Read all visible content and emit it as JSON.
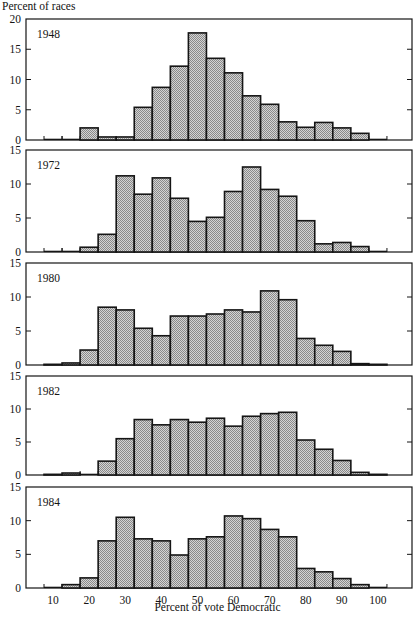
{
  "chart_data": {
    "type": "bar",
    "subtype": "histogram-small-multiples",
    "title": "",
    "ylabel": "Percent of races",
    "xlabel": "Percent of vote Democratic",
    "x_ticks": [
      10,
      20,
      30,
      40,
      50,
      60,
      70,
      80,
      90,
      100
    ],
    "xlim": [
      7.5,
      102.5
    ],
    "bin_width": 5,
    "categories": [
      10,
      15,
      20,
      25,
      30,
      35,
      40,
      45,
      50,
      55,
      60,
      65,
      70,
      75,
      80,
      85,
      90,
      95,
      100
    ],
    "grid": false,
    "legend": null,
    "fill": "halftone gray",
    "panels": [
      {
        "label": "1948",
        "ylim": [
          0,
          20
        ],
        "y_ticks": [
          0,
          5,
          10,
          15,
          20
        ],
        "values": [
          0,
          0,
          2.0,
          0.5,
          0.5,
          5.4,
          8.7,
          12.2,
          17.7,
          13.5,
          11.1,
          7.3,
          5.9,
          3.0,
          2.1,
          2.9,
          2.0,
          1.1,
          0
        ]
      },
      {
        "label": "1972",
        "ylim": [
          0,
          15
        ],
        "y_ticks": [
          0,
          5,
          10,
          15
        ],
        "values": [
          0,
          0,
          0.7,
          2.6,
          11.2,
          8.5,
          10.9,
          7.9,
          4.5,
          5.1,
          8.9,
          12.5,
          9.2,
          8.2,
          4.6,
          1.2,
          1.4,
          0.8,
          0
        ]
      },
      {
        "label": "1980",
        "ylim": [
          0,
          15
        ],
        "y_ticks": [
          0,
          5,
          10,
          15
        ],
        "values": [
          0.1,
          0.3,
          2.2,
          8.5,
          8.1,
          5.4,
          4.3,
          7.2,
          7.2,
          7.5,
          8.1,
          7.8,
          10.9,
          9.6,
          3.9,
          2.9,
          2.0,
          0.2,
          0.1
        ]
      },
      {
        "label": "1982",
        "ylim": [
          0,
          15
        ],
        "y_ticks": [
          0,
          5,
          10,
          15
        ],
        "values": [
          0.1,
          0.3,
          0,
          2.1,
          5.5,
          8.4,
          7.6,
          8.4,
          8.0,
          8.6,
          7.4,
          8.9,
          9.3,
          9.5,
          5.3,
          3.9,
          2.2,
          0.4,
          0.1
        ]
      },
      {
        "label": "1984",
        "ylim": [
          0,
          15
        ],
        "y_ticks": [
          0,
          5,
          10,
          15
        ],
        "values": [
          0,
          0.5,
          1.5,
          7.0,
          10.5,
          7.3,
          7.0,
          4.9,
          7.3,
          7.6,
          10.7,
          10.3,
          8.7,
          7.6,
          2.9,
          2.4,
          1.4,
          0.5,
          0
        ]
      }
    ]
  },
  "layout": {
    "frame_left": 26,
    "frame_right": 412,
    "x_px_at_7_5": 44,
    "px_per_unit_x": 3.61,
    "panels_px": [
      {
        "top": 19,
        "zero": 140
      },
      {
        "top": 150,
        "zero": 252
      },
      {
        "top": 263,
        "zero": 365
      },
      {
        "top": 376,
        "zero": 475
      },
      {
        "top": 487,
        "zero": 588
      }
    ],
    "colors": {
      "ink": "#151515",
      "fill_light": "#d4d4d4",
      "fill_dark": "#8a8a8a"
    }
  }
}
